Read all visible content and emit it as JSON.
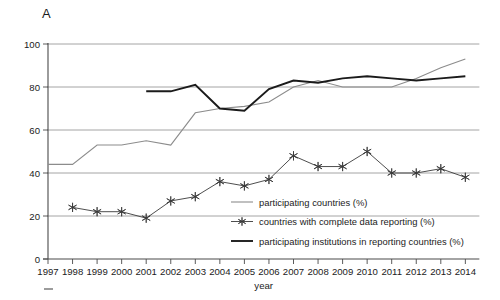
{
  "figure": {
    "panel_label": "A"
  },
  "chart_data": {
    "type": "line",
    "title": "",
    "xlabel": "year",
    "ylabel": "",
    "ylim": [
      0,
      100
    ],
    "yticks": [
      0,
      20,
      40,
      60,
      80,
      100
    ],
    "ytick_labels": [
      "0",
      "20",
      "40",
      "60",
      "80",
      "100"
    ],
    "grid": true,
    "grid_axis": "y",
    "legend_position": "inside-lower-right",
    "categories": [
      1997,
      1998,
      1999,
      2000,
      2001,
      2002,
      2003,
      2004,
      2005,
      2006,
      2007,
      2008,
      2009,
      2010,
      2011,
      2012,
      2013,
      2014
    ],
    "xtick_labels": [
      "1997",
      "1998",
      "1999",
      "2000",
      "2001",
      "2002",
      "2003",
      "2004",
      "2005",
      "2006",
      "2007",
      "2008",
      "2009",
      "2010",
      "2011",
      "2012",
      "2013",
      "2014"
    ],
    "series": [
      {
        "name": "participating countries (%)",
        "color": "#8c8c8c",
        "marker": "none",
        "linewidth": 1.1,
        "x": [
          1997,
          1998,
          1999,
          2000,
          2001,
          2002,
          2003,
          2004,
          2005,
          2006,
          2007,
          2008,
          2009,
          2010,
          2011,
          2012,
          2013,
          2014
        ],
        "values": [
          44,
          44,
          53,
          53,
          55,
          53,
          68,
          70,
          71,
          73,
          80,
          83,
          80,
          80,
          80,
          84,
          89,
          93
        ]
      },
      {
        "name": "countries with complete data reporting (%)",
        "color": "#3a3a3a",
        "marker": "star",
        "linewidth": 0.9,
        "x": [
          1998,
          1999,
          2000,
          2001,
          2002,
          2003,
          2004,
          2005,
          2006,
          2007,
          2008,
          2009,
          2010,
          2011,
          2012,
          2013,
          2014
        ],
        "values": [
          24,
          22,
          22,
          19,
          27,
          29,
          36,
          34,
          37,
          48,
          43,
          43,
          50,
          40,
          40,
          42,
          38
        ]
      },
      {
        "name": "participating institutions in reporting countries (%)",
        "color": "#1b1b1b",
        "marker": "none",
        "linewidth": 1.9,
        "x": [
          2001,
          2002,
          2003,
          2004,
          2005,
          2006,
          2007,
          2008,
          2009,
          2010,
          2011,
          2012,
          2013,
          2014
        ],
        "values": [
          78,
          78,
          81,
          70,
          69,
          79,
          83,
          82,
          84,
          85,
          84,
          83,
          84,
          85
        ]
      }
    ]
  },
  "legend": {
    "items": [
      {
        "label": "participating countries (%)",
        "color": "#8c8c8c",
        "marker": "none",
        "linewidth": 1.1
      },
      {
        "label": "countries with complete data reporting (%)",
        "color": "#3a3a3a",
        "marker": "star",
        "linewidth": 0.9
      },
      {
        "label": "participating institutions in reporting countries (%)",
        "color": "#1b1b1b",
        "marker": "none",
        "linewidth": 1.9
      }
    ]
  }
}
